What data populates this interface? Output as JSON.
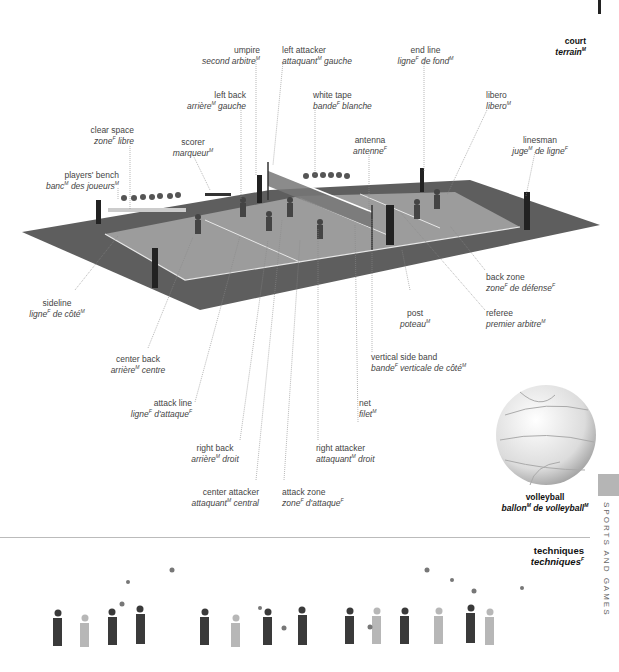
{
  "section": {
    "court": {
      "en": "court",
      "fr": "terrain",
      "fr_gender": "M"
    },
    "techniques": {
      "en": "techniques",
      "fr": "techniques",
      "fr_gender": "F"
    }
  },
  "side_tab": {
    "label": "SPORTS AND GAMES"
  },
  "labels": {
    "umpire": {
      "en": "umpire",
      "fr": "second arbitre",
      "g": "M"
    },
    "left_attacker": {
      "en": "left attacker",
      "fr": "attaquant",
      "g": "M",
      "fr2": " gauche"
    },
    "end_line": {
      "en": "end line",
      "fr": "ligne",
      "g": "F",
      "fr2": " de fond",
      "g2": "M"
    },
    "left_back": {
      "en": "left back",
      "fr": "arrière",
      "g": "M",
      "fr2": " gauche"
    },
    "white_tape": {
      "en": "white tape",
      "fr": "bande",
      "g": "F",
      "fr2": " blanche"
    },
    "libero": {
      "en": "libero",
      "fr": "libero",
      "g": "M"
    },
    "clear_space": {
      "en": "clear space",
      "fr": "zone",
      "g": "F",
      "fr2": " libre"
    },
    "scorer": {
      "en": "scorer",
      "fr": "marqueur",
      "g": "M"
    },
    "antenna": {
      "en": "antenna",
      "fr": "antenne",
      "g": "F"
    },
    "linesman": {
      "en": "linesman",
      "fr": "juge",
      "g": "M",
      "fr2": " de ligne",
      "g2": "F"
    },
    "players_bench": {
      "en": "players' bench",
      "fr": "banc",
      "g": "M",
      "fr2": " des joueurs",
      "g2": "M"
    },
    "sideline": {
      "en": "sideline",
      "fr": "ligne",
      "g": "F",
      "fr2": " de côté",
      "g2": "M"
    },
    "back_zone": {
      "en": "back zone",
      "fr": "zone",
      "g": "F",
      "fr2": " de défense",
      "g2": "F"
    },
    "post": {
      "en": "post",
      "fr": "poteau",
      "g": "M"
    },
    "referee": {
      "en": "referee",
      "fr": "premier arbitre",
      "g": "M"
    },
    "center_back": {
      "en": "center back",
      "fr": "arrière",
      "g": "M",
      "fr2": " centre"
    },
    "vertical_side_band": {
      "en": "vertical side band",
      "fr": "bande",
      "g": "F",
      "fr2": " verticale de côté",
      "g2": "M"
    },
    "attack_line": {
      "en": "attack line",
      "fr": "ligne",
      "g": "F",
      "fr2": " d'attaque",
      "g2": "F"
    },
    "net": {
      "en": "net",
      "fr": "filet",
      "g": "M"
    },
    "right_back": {
      "en": "right back",
      "fr": "arrière",
      "g": "M",
      "fr2": " droit"
    },
    "right_attacker": {
      "en": "right attacker",
      "fr": "attaquant",
      "g": "M",
      "fr2": " droit"
    },
    "center_attacker": {
      "en": "center attacker",
      "fr": "attaquant",
      "g": "M",
      "fr2": " central"
    },
    "attack_zone": {
      "en": "attack zone",
      "fr": "zone",
      "g": "F",
      "fr2": " d'attaque",
      "g2": "F"
    },
    "volleyball": {
      "en": "volleyball",
      "fr": "ballon",
      "g": "M",
      "fr2": " de volleyball",
      "g2": "M"
    }
  },
  "colors": {
    "surround": "#5e5e5e",
    "playing_area": "#9a9a9a",
    "lines": "#e8e8e8",
    "leader_lines": "#888888",
    "tab": "#b5b5b5"
  }
}
